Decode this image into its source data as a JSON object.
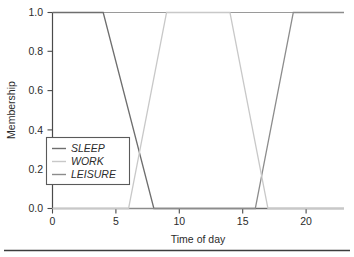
{
  "chart_data": {
    "type": "line",
    "title": "",
    "subtitle": "",
    "xlabel": "Time of day",
    "ylabel": "Membership",
    "xlim": [
      0,
      23
    ],
    "ylim": [
      0.0,
      1.0
    ],
    "xticks": [
      0,
      5,
      10,
      15,
      20
    ],
    "xticklabels": [
      "0",
      "5",
      "10",
      "15",
      "20"
    ],
    "yticks": [
      0.0,
      0.2,
      0.4,
      0.6,
      0.8,
      1.0
    ],
    "yticklabels": [
      "0.0",
      "0.2",
      "0.4",
      "0.6",
      "0.8",
      "1.0"
    ],
    "grid": false,
    "legend_position": "lower left",
    "series": [
      {
        "name": "SLEEP",
        "color": "#6e6e6e",
        "x": [
          0,
          4,
          8,
          23
        ],
        "values": [
          1.0,
          1.0,
          0.0,
          0.0
        ]
      },
      {
        "name": "WORK",
        "color": "#c8c8c8",
        "x": [
          0,
          6,
          9,
          14,
          17,
          23
        ],
        "values": [
          0.0,
          0.0,
          1.0,
          1.0,
          0.0,
          0.0
        ]
      },
      {
        "name": "LEISURE",
        "color": "#8c8c8c",
        "x": [
          0,
          16,
          19,
          23
        ],
        "values": [
          0.0,
          0.0,
          1.0,
          1.0
        ]
      }
    ]
  },
  "axes": {
    "xlabel": "Time of day",
    "ylabel": "Membership",
    "xticklabels": [
      "0",
      "5",
      "10",
      "15",
      "20"
    ],
    "yticklabels": [
      "0.0",
      "0.2",
      "0.4",
      "0.6",
      "0.8",
      "1.0"
    ]
  },
  "legend": {
    "entries": [
      {
        "label": "SLEEP",
        "color": "#6e6e6e"
      },
      {
        "label": "WORK",
        "color": "#c8c8c8"
      },
      {
        "label": "LEISURE",
        "color": "#8c8c8c"
      }
    ]
  },
  "colors": {
    "axis": "#4a4a4a",
    "text": "#2b2b2b",
    "legend_border": "#5a5a5a",
    "rule": "#3c3c3c",
    "background": "#ffffff"
  }
}
